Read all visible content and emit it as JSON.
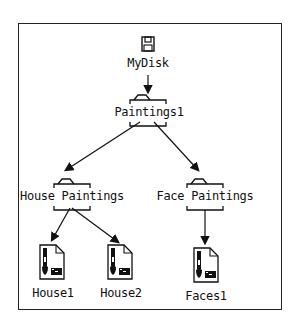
{
  "nodes": {
    "root": {
      "label": "MyDisk",
      "icon": "floppy-disk-icon"
    },
    "paintings1": {
      "label": "Paintings1",
      "icon": "folder-icon"
    },
    "house_paintings": {
      "label": "House Paintings",
      "icon": "folder-icon"
    },
    "face_paintings": {
      "label": "Face Paintings",
      "icon": "folder-icon"
    },
    "house1": {
      "label": "House1",
      "icon": "paint-document-icon"
    },
    "house2": {
      "label": "House2",
      "icon": "paint-document-icon"
    },
    "faces1": {
      "label": "Faces1",
      "icon": "paint-document-icon"
    }
  },
  "edges": [
    [
      "MyDisk",
      "Paintings1"
    ],
    [
      "Paintings1",
      "House Paintings"
    ],
    [
      "Paintings1",
      "Face Paintings"
    ],
    [
      "House Paintings",
      "House1"
    ],
    [
      "House Paintings",
      "House2"
    ],
    [
      "Face Paintings",
      "Faces1"
    ]
  ]
}
